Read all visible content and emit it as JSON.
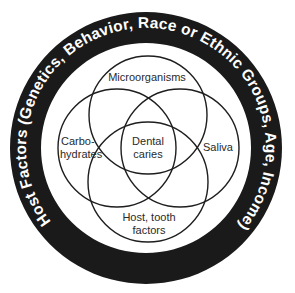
{
  "diagram": {
    "type": "venn",
    "outer_ring": {
      "label": "Host Factors (Genetics, Behavior, Race or Ethnic Groups, Age, Income)",
      "fill_color": "#1a1a1a",
      "text_color": "#ffffff"
    },
    "circles": [
      {
        "id": "top",
        "label_lines": [
          "Microorganisms"
        ]
      },
      {
        "id": "left",
        "label_lines": [
          "Carbo-",
          "hydrates"
        ]
      },
      {
        "id": "right",
        "label_lines": [
          "Saliva"
        ]
      },
      {
        "id": "bottom",
        "label_lines": [
          "Host, tooth",
          "factors"
        ]
      }
    ],
    "center": {
      "label_lines": [
        "Dental",
        "caries"
      ]
    }
  }
}
